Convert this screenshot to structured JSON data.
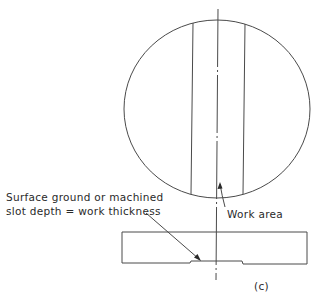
{
  "figure": {
    "panel_label": "(c)",
    "annotations": {
      "surface_line1": "Surface ground or machined",
      "surface_line2": "slot depth = work thickness",
      "work_area": "Work area"
    },
    "colors": {
      "line": "#4a4a4a",
      "text": "#2a2a2a",
      "background": "#ffffff"
    }
  }
}
